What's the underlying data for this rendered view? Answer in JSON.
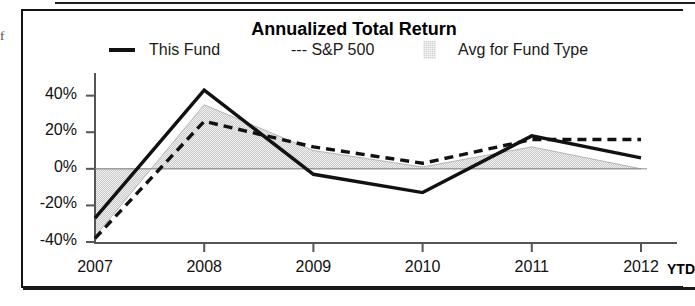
{
  "figure": {
    "edge_fragment": "f",
    "ytd_label": "YTD"
  },
  "legend": {
    "items": [
      {
        "label": "This Fund",
        "style": "solid-line",
        "icon": "solid-line-swatch"
      },
      {
        "label": "--- S&P 500",
        "style": "dashed-line",
        "icon": "dashed-line-swatch"
      },
      {
        "label": "Avg for Fund Type",
        "style": "shaded-area",
        "icon": "shaded-area-swatch"
      }
    ]
  },
  "chart_data": {
    "type": "line",
    "title": "Annualized Total Return",
    "xlabel": "",
    "ylabel": "",
    "x": [
      "2007",
      "2008",
      "2009",
      "2010",
      "2011",
      "2012"
    ],
    "categories": [
      "2007",
      "2008",
      "2009",
      "2010",
      "2011",
      "2012"
    ],
    "xtick_labels": [
      "2007",
      "2008",
      "2009",
      "2010",
      "2011",
      "2012"
    ],
    "ytick_labels": [
      "40%",
      "20%",
      "0%",
      "-20%",
      "-40%"
    ],
    "ytick_values": [
      40,
      20,
      0,
      -20,
      -40
    ],
    "ylim": [
      -40,
      48
    ],
    "grid": false,
    "zero_line": true,
    "legend_position": "top",
    "series": [
      {
        "name": "This Fund",
        "style": "solid",
        "color": "#111111",
        "values": [
          -27,
          43,
          -3,
          -13,
          18,
          6
        ]
      },
      {
        "name": "S&P 500",
        "style": "dashed",
        "color": "#111111",
        "values": [
          -38,
          26,
          12,
          3,
          16,
          16
        ]
      },
      {
        "name": "Avg for Fund Type",
        "style": "area",
        "color": "#cfcfcf",
        "values": [
          -37,
          35,
          10,
          1,
          12,
          0
        ]
      }
    ],
    "colors": {
      "this_fund": "#111111",
      "sp500": "#111111",
      "avg_fund_type": "#cfcfcf",
      "axis": "#4a4a4a"
    }
  }
}
